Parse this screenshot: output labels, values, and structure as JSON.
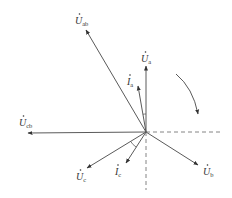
{
  "diagram": {
    "type": "phasor-diagram",
    "colors": {
      "line": "#5a5a5a",
      "text": "#333333",
      "dashed": "#777777"
    },
    "origin": {
      "x": 146,
      "y": 132
    },
    "rotation_indicator": "clockwise",
    "vectors": [
      {
        "id": "Ua",
        "symbol": "U",
        "sub": "a",
        "accent": "dot",
        "tip": {
          "x": 146,
          "y": 66
        },
        "label_pos": {
          "x": 141,
          "y": 62
        }
      },
      {
        "id": "Ia",
        "symbol": "I",
        "sub": "a",
        "accent": "dot",
        "tip": {
          "x": 138,
          "y": 86
        },
        "label_pos": {
          "x": 127,
          "y": 85
        }
      },
      {
        "id": "Uab",
        "symbol": "U",
        "sub": "ab",
        "accent": "dot",
        "tip": {
          "x": 86,
          "y": 30
        },
        "label_pos": {
          "x": 75,
          "y": 24
        }
      },
      {
        "id": "Ucb",
        "symbol": "U",
        "sub": "cb",
        "accent": "dot",
        "tip": {
          "x": 28,
          "y": 133
        },
        "label_pos": {
          "x": 19,
          "y": 126
        }
      },
      {
        "id": "Uc",
        "symbol": "U",
        "sub": "c",
        "accent": "dot",
        "tip": {
          "x": 87,
          "y": 168
        },
        "label_pos": {
          "x": 76,
          "y": 180
        }
      },
      {
        "id": "Ic",
        "symbol": "I",
        "sub": "c",
        "accent": "dot",
        "tip": {
          "x": 126,
          "y": 163
        },
        "label_pos": {
          "x": 115,
          "y": 175
        }
      },
      {
        "id": "Ub",
        "symbol": "U",
        "sub": "b",
        "accent": "dot",
        "tip": {
          "x": 198,
          "y": 165
        },
        "label_pos": {
          "x": 203,
          "y": 175
        }
      }
    ],
    "reference_axes": {
      "horizontal_dashed": {
        "from": {
          "x": 146,
          "y": 132
        },
        "to": {
          "x": 222,
          "y": 132
        }
      },
      "vertical_dashed": {
        "from": {
          "x": 146,
          "y": 132
        },
        "to": {
          "x": 146,
          "y": 190
        }
      }
    },
    "angle_arcs": [
      {
        "between": [
          "Ua",
          "Ia"
        ],
        "radius": 18
      },
      {
        "between": [
          "Uc",
          "Ic"
        ],
        "radius": 18
      }
    ],
    "rotation_arrow": {
      "from": {
        "x": 176,
        "y": 74
      },
      "to": {
        "x": 198,
        "y": 114
      }
    }
  }
}
